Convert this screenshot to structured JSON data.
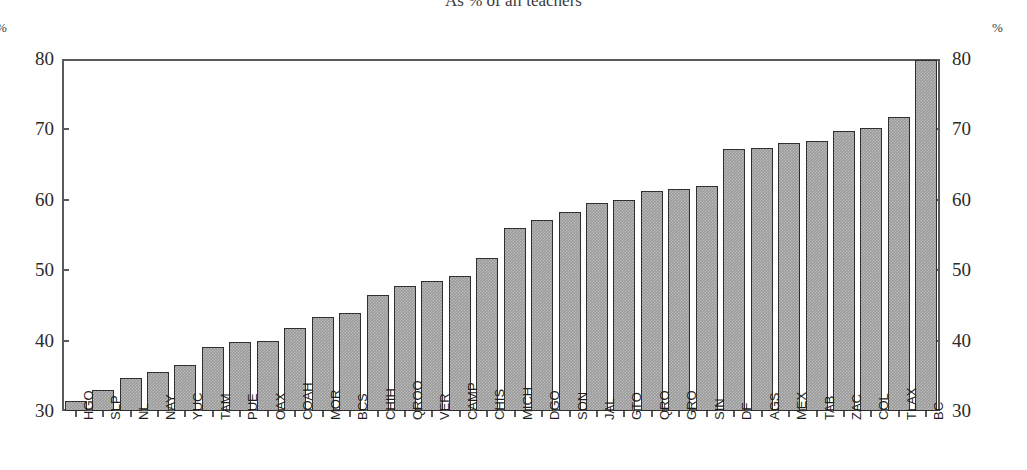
{
  "chart_data": {
    "type": "bar",
    "title": "As % of all teachers",
    "xlabel": "",
    "ylabel": "%",
    "y_unit_label": "%",
    "ylim": [
      30,
      80
    ],
    "yticks": [
      30,
      40,
      50,
      60,
      70,
      80
    ],
    "grid": false,
    "legend": null,
    "axes": {
      "left_axis_labels": [
        "80",
        "70",
        "60",
        "50",
        "40",
        "30"
      ],
      "right_axis_labels": [
        "80",
        "70",
        "60",
        "50",
        "40",
        "30"
      ],
      "left_unit": "%",
      "right_unit": "%"
    },
    "categories": [
      "HGO",
      "SLP",
      "NL",
      "NAY",
      "YUC",
      "TAM",
      "PUE",
      "OAX",
      "COAH",
      "MOR",
      "BCS",
      "CHIH",
      "QROO",
      "VER",
      "CAMP",
      "CHIS",
      "MICH",
      "DGO",
      "SON",
      "JAL",
      "GTO",
      "QRO",
      "GRO",
      "SIN",
      "DF",
      "AGS",
      "MEX",
      "TAB",
      "ZAC",
      "COL",
      "TLAX",
      "BC"
    ],
    "values": [
      31.4,
      33.0,
      34.7,
      35.5,
      36.5,
      39.1,
      39.8,
      40.0,
      41.8,
      43.3,
      43.9,
      46.5,
      47.8,
      48.4,
      49.2,
      51.7,
      56.0,
      57.1,
      58.3,
      59.5,
      60.0,
      61.2,
      61.5,
      62.0,
      67.2,
      67.3,
      68.0,
      68.3,
      69.8,
      70.2,
      71.8,
      79.8
    ],
    "bar_style": {
      "fill_color": "#9a9a9a",
      "border_color": "#2f2f2f",
      "texture": "crosshatch-dither"
    },
    "frame_color": "#5a5a5a"
  }
}
